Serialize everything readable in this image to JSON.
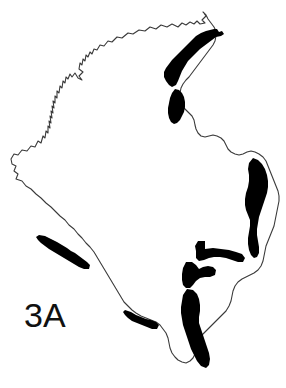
{
  "figure": {
    "label": "3A",
    "label_color": "#111111",
    "background_color": "#ffffff",
    "outline_color": "#3a3a3a",
    "highlight_color": "#000000",
    "width": 286,
    "height": 388,
    "region_name": "Colombia"
  },
  "map": {
    "outline_stroke_width": 1,
    "highlighted_segments": [
      {
        "name": "caribbean-north-coast-band"
      },
      {
        "name": "northwest-gulf-band"
      },
      {
        "name": "east-border-band"
      },
      {
        "name": "southeast-horizontal-band"
      },
      {
        "name": "south-central-band"
      },
      {
        "name": "south-long-band"
      },
      {
        "name": "pacific-southwest-coast-band"
      },
      {
        "name": "south-border-band"
      }
    ]
  }
}
